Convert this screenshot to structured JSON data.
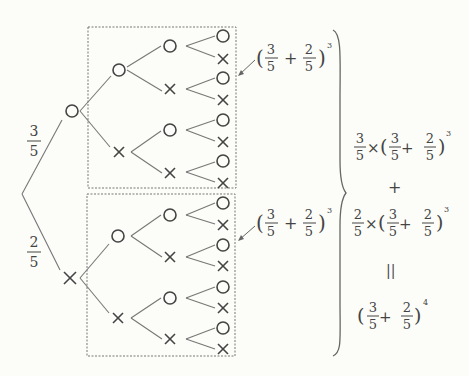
{
  "diagram": {
    "type": "probability-tree",
    "symbols": {
      "success": "○",
      "failure": "×"
    },
    "root_branches": [
      {
        "label_num": "3",
        "label_den": "5",
        "node": "○"
      },
      {
        "label_num": "2",
        "label_den": "5",
        "node": "×"
      }
    ],
    "subtree_annotation": {
      "open": "(",
      "a_num": "3",
      "a_den": "5",
      "plus": "+",
      "b_num": "2",
      "b_den": "5",
      "close": ")",
      "exponent": "3"
    },
    "right_expression": {
      "term1": {
        "coef_num": "3",
        "coef_den": "5",
        "times": "×",
        "a_num": "3",
        "a_den": "5",
        "plus": "+",
        "b_num": "2",
        "b_den": "5",
        "exponent": "3"
      },
      "plus": "+",
      "term2": {
        "coef_num": "2",
        "coef_den": "5",
        "times": "×",
        "a_num": "3",
        "a_den": "5",
        "plus": "+",
        "b_num": "2",
        "b_den": "5",
        "exponent": "3"
      },
      "equals": "||",
      "result": {
        "a_num": "3",
        "a_den": "5",
        "plus": "+",
        "b_num": "2",
        "b_den": "5",
        "exponent": "4"
      }
    },
    "levels": 4
  }
}
